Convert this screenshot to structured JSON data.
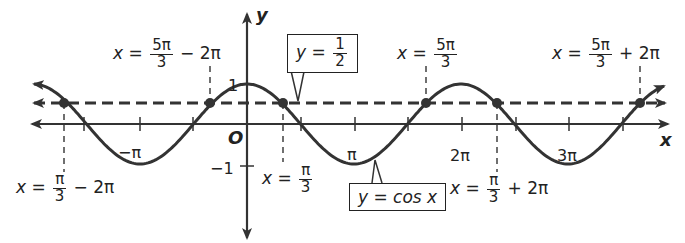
{
  "axes": {
    "x_label": "x",
    "y_label": "y",
    "origin_label": "O"
  },
  "ticks": {
    "neg_pi": "−π",
    "pi": "π",
    "two_pi": "2π",
    "three_pi": "3π",
    "y_one": "1",
    "y_neg_one": "−1"
  },
  "annotations": {
    "a1": {
      "lhs": "x =",
      "num": "5π",
      "den": "3",
      "rhs": "− 2π"
    },
    "a2": {
      "lhs": "x =",
      "num": "5π",
      "den": "3",
      "rhs": ""
    },
    "a3": {
      "lhs": "x =",
      "num": "5π",
      "den": "3",
      "rhs": "+ 2π"
    },
    "b1": {
      "lhs": "x =",
      "num": "π",
      "den": "3",
      "rhs": "− 2π"
    },
    "b2": {
      "lhs": "x =",
      "num": "π",
      "den": "3",
      "rhs": ""
    },
    "b3": {
      "lhs": "x =",
      "num": "π",
      "den": "3",
      "rhs": "+ 2π"
    }
  },
  "callouts": {
    "line": {
      "lhs": "y =",
      "num": "1",
      "den": "2"
    },
    "curve": "y = cos x"
  },
  "colors": {
    "ink": "#222222",
    "background": "#ffffff"
  }
}
